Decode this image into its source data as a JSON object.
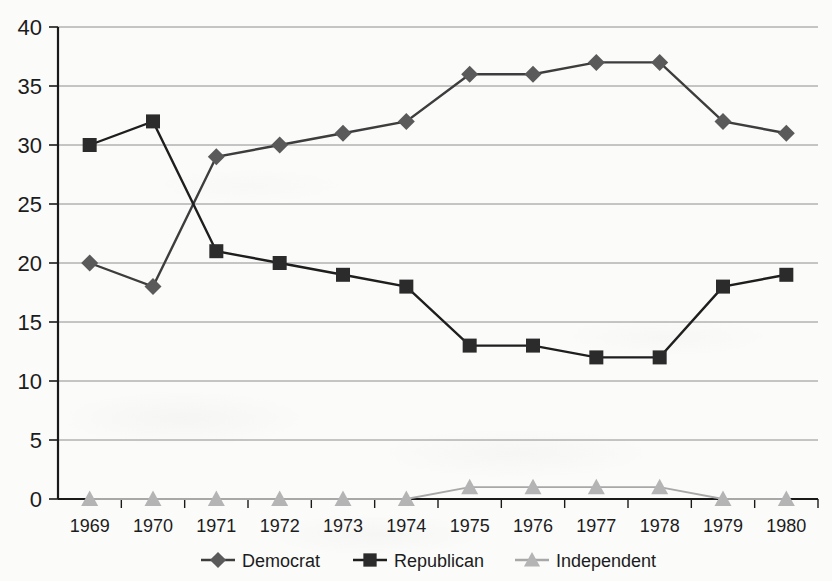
{
  "chart_data": {
    "type": "line",
    "title": "",
    "subtitle": "",
    "xlabel": "",
    "ylabel": "",
    "categories": [
      "1969",
      "1970",
      "1971",
      "1972",
      "1973",
      "1974",
      "1975",
      "1976",
      "1977",
      "1978",
      "1979",
      "1980"
    ],
    "ylim": [
      0,
      40
    ],
    "ytick_labels": [
      "0",
      "5",
      "10",
      "15",
      "20",
      "25",
      "30",
      "35",
      "40"
    ],
    "ytick_values": [
      0,
      5,
      10,
      15,
      20,
      25,
      30,
      35,
      40
    ],
    "grid": true,
    "grid_axis": "y",
    "legend_position": "bottom",
    "series": [
      {
        "name": "Democrat",
        "marker": "diamond",
        "color": "#5a5a5a",
        "line_color": "#3d3d3d",
        "values": [
          20,
          18,
          29,
          30,
          31,
          32,
          36,
          36,
          37,
          37,
          32,
          31
        ]
      },
      {
        "name": "Republican",
        "marker": "square",
        "color": "#2b2b2b",
        "line_color": "#1e1e1e",
        "values": [
          30,
          32,
          21,
          20,
          19,
          18,
          13,
          13,
          12,
          12,
          18,
          19
        ]
      },
      {
        "name": "Independent",
        "marker": "triangle",
        "color": "#b4b4b4",
        "line_color": "#a8a8a8",
        "values": [
          0,
          0,
          0,
          0,
          0,
          0,
          1,
          1,
          1,
          1,
          0,
          0
        ]
      }
    ]
  },
  "legend": {
    "items": [
      {
        "label": "Democrat",
        "marker": "diamond-icon",
        "color": "#5a5a5a"
      },
      {
        "label": "Republican",
        "marker": "square-icon",
        "color": "#2b2b2b"
      },
      {
        "label": "Independent",
        "marker": "triangle-icon",
        "color": "#b4b4b4"
      }
    ]
  }
}
